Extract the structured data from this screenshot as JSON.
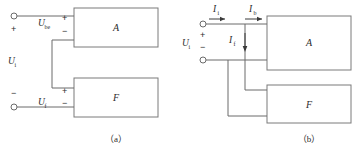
{
  "figure": {
    "panels": [
      {
        "id": "panel-a",
        "caption": "（a）",
        "blocks": [
          {
            "id": "block-a",
            "label": "A"
          },
          {
            "id": "block-f",
            "label": "F"
          }
        ],
        "labels": {
          "input_voltage": "U",
          "input_voltage_sub": "i",
          "net_input_voltage": "U",
          "net_input_voltage_sub": "be",
          "feedback_voltage": "U",
          "feedback_voltage_sub": "f"
        },
        "signs": {
          "input_plus": "+",
          "input_minus": "−",
          "be_plus": "+",
          "be_minus": "−",
          "f_plus": "+",
          "f_minus": "−"
        }
      },
      {
        "id": "panel-b",
        "caption": "（b）",
        "blocks": [
          {
            "id": "block-a",
            "label": "A"
          },
          {
            "id": "block-f",
            "label": "F"
          }
        ],
        "labels": {
          "input_voltage": "U",
          "input_voltage_sub": "i",
          "input_current": "I",
          "input_current_sub": "i",
          "base_current": "I",
          "base_current_sub": "b",
          "feedback_current": "I",
          "feedback_current_sub": "f"
        },
        "signs": {
          "input_plus": "+",
          "input_minus": "−"
        }
      }
    ],
    "colors": {
      "wire": "#6b6b6b",
      "block_border": "#7a7a7a",
      "arrow": "#3a3a3a",
      "text": "#2b2b2b",
      "background": "#ffffff"
    }
  }
}
